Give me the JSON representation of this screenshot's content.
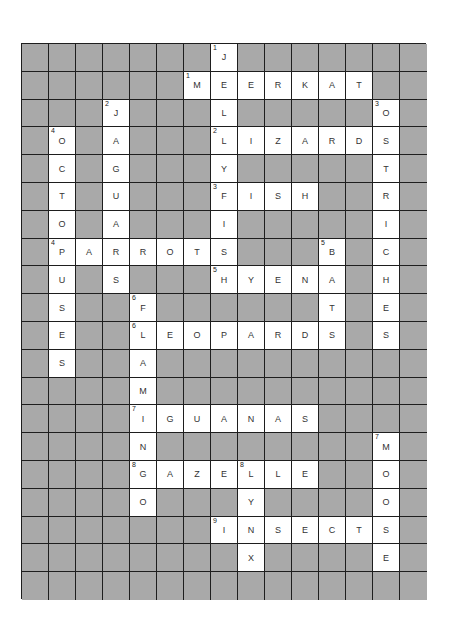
{
  "puzzle": {
    "cols": 15,
    "rows": 20,
    "colors": {
      "block": "#a9a9a9",
      "open": "#ffffff",
      "border": "#1e1e1e",
      "text": "#333333"
    },
    "words": [
      {
        "number": "1",
        "direction": "down",
        "answer": "JELLYFISH",
        "row": 0,
        "col": 7
      },
      {
        "number": "1",
        "direction": "across",
        "answer": "MEERKAT",
        "row": 1,
        "col": 6
      },
      {
        "number": "2",
        "direction": "down",
        "answer": "JAGUARS",
        "row": 2,
        "col": 3
      },
      {
        "number": "3",
        "direction": "down",
        "answer": "OSTRICHES",
        "row": 2,
        "col": 13
      },
      {
        "number": "2",
        "direction": "across",
        "answer": "LIZARDS",
        "row": 3,
        "col": 7
      },
      {
        "number": "4",
        "direction": "down",
        "answer": "OCTOPUSES",
        "row": 3,
        "col": 1
      },
      {
        "number": "3",
        "direction": "across",
        "answer": "FISH",
        "row": 5,
        "col": 7
      },
      {
        "number": "4",
        "direction": "across",
        "answer": "PARROTS",
        "row": 7,
        "col": 1
      },
      {
        "number": "5",
        "direction": "down",
        "answer": "BATS",
        "row": 7,
        "col": 11
      },
      {
        "number": "5",
        "direction": "across",
        "answer": "HYENA",
        "row": 8,
        "col": 7
      },
      {
        "number": "6",
        "direction": "down",
        "answer": "FLAMINGO",
        "row": 9,
        "col": 4
      },
      {
        "number": "6",
        "direction": "across",
        "answer": "LEOPARDS",
        "row": 10,
        "col": 4
      },
      {
        "number": "7",
        "direction": "across",
        "answer": "IGUANAS",
        "row": 13,
        "col": 4
      },
      {
        "number": "7",
        "direction": "down",
        "answer": "MOOSE",
        "row": 14,
        "col": 13
      },
      {
        "number": "8",
        "direction": "across",
        "answer": "GAZELLE",
        "row": 15,
        "col": 4
      },
      {
        "number": "8",
        "direction": "down",
        "answer": "LYNX",
        "row": 15,
        "col": 8
      },
      {
        "number": "9",
        "direction": "across",
        "answer": "INSECTS",
        "row": 17,
        "col": 7
      }
    ]
  }
}
